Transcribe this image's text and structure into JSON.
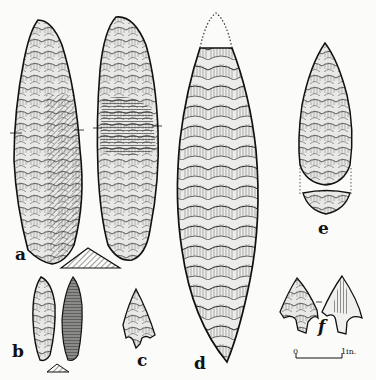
{
  "plate": {
    "background": "#fbfbfa",
    "ink": "#1a1a1a",
    "figures": [
      {
        "id": "a",
        "label": "a",
        "description": "Long flint blade, two faces with triangular cross-section"
      },
      {
        "id": "b",
        "label": "b",
        "description": "Small leaf-shaped point, two faces with cross-section"
      },
      {
        "id": "c",
        "label": "c",
        "description": "Small barbed and tanged arrowhead"
      },
      {
        "id": "d",
        "label": "d",
        "description": "Large bifacial lanceolate point with restored dotted tip"
      },
      {
        "id": "e",
        "label": "e",
        "description": "Pear-shaped bifacial point with cross-section below"
      },
      {
        "id": "f",
        "label": "f",
        "description": "Barbed and tanged arrowhead, two faces"
      }
    ],
    "scale_bar": {
      "start_label": "0",
      "end_label": "1in."
    }
  }
}
